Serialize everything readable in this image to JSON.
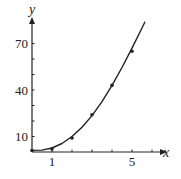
{
  "chart_data": {
    "type": "scatter",
    "title": "",
    "xlabel": "x",
    "ylabel": "y",
    "x_ticks": [
      1,
      2,
      3,
      4,
      5,
      6
    ],
    "x_tick_labels": {
      "1": "1",
      "5": "5"
    },
    "y_ticks": [
      10,
      20,
      30,
      40,
      50,
      60,
      70
    ],
    "y_tick_labels": {
      "10": "10",
      "40": "40",
      "70": "70"
    },
    "xlim": [
      0,
      7.2
    ],
    "ylim": [
      0,
      85
    ],
    "grid": false,
    "legend": false,
    "series": [
      {
        "name": "data points",
        "type": "scatter",
        "x": [
          0,
          1,
          2,
          3,
          4,
          5
        ],
        "y": [
          1,
          2,
          9,
          24,
          43,
          65
        ]
      },
      {
        "name": "fitted curve",
        "type": "line",
        "x": [
          0,
          0.5,
          1,
          1.5,
          2,
          2.5,
          3,
          3.5,
          4,
          4.5,
          5,
          5.5,
          5.65
        ],
        "y": [
          1,
          1.2,
          2.6,
          5.5,
          10,
          16,
          23.5,
          32.5,
          43,
          54.5,
          67,
          80,
          84
        ]
      }
    ]
  }
}
